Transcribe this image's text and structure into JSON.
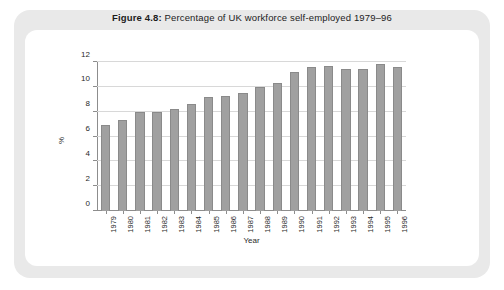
{
  "figure": {
    "label": "Figure 4.8:",
    "caption": "Percentage of UK workforce self-employed 1979–96"
  },
  "colors": {
    "bar_fill": "#a0a0a0",
    "bar_edge": "#8a8a8a",
    "axis": "#8d8d8d",
    "gridline": "#d8d8d8",
    "outer_frame": "#e9e9e9",
    "inner_card": "#ffffff",
    "text": "#1c1c1c"
  },
  "chart_data": {
    "type": "bar",
    "title": "Figure 4.8: Percentage of UK workforce self-employed 1979–96",
    "xlabel": "Year",
    "ylabel": "%",
    "categories": [
      "1979",
      "1980",
      "1981",
      "1982",
      "1983",
      "1984",
      "1985",
      "1986",
      "1987",
      "1988",
      "1989",
      "1990",
      "1991",
      "1992",
      "1993",
      "1994",
      "1995",
      "1996"
    ],
    "values": [
      6.9,
      7.3,
      8.0,
      8.0,
      8.2,
      8.6,
      9.2,
      9.3,
      9.5,
      10.0,
      10.3,
      11.2,
      11.6,
      11.7,
      11.4,
      11.4,
      11.8,
      11.6
    ],
    "ylim": [
      0,
      12
    ],
    "yticks": [
      0,
      2,
      4,
      6,
      8,
      10,
      12
    ],
    "ytick_labels": [
      "0",
      "2",
      "4",
      "6",
      "8",
      "10",
      "12"
    ],
    "grid": true,
    "legend": null,
    "legend_position": "none"
  }
}
